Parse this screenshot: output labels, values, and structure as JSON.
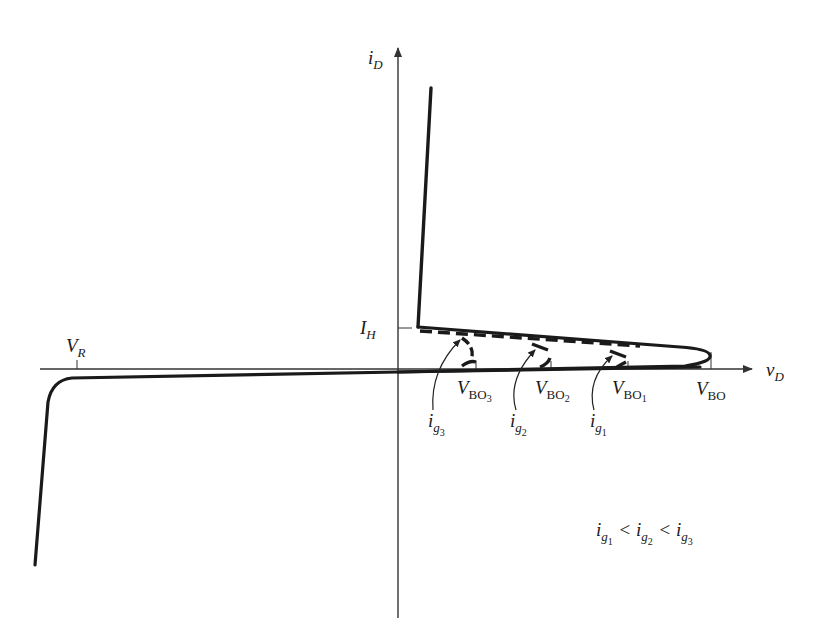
{
  "diagram": {
    "type": "thyristor-iv-characteristic",
    "colors": {
      "curve": "#1a1a1a",
      "axis": "#333333",
      "background": "#ffffff"
    },
    "axes": {
      "y": {
        "symbol": "i",
        "subscript": "D"
      },
      "x": {
        "symbol": "v",
        "subscript": "D"
      }
    },
    "labels": {
      "holding_current": {
        "symbol": "I",
        "subscript": "H"
      },
      "reverse_voltage": {
        "symbol": "V",
        "subscript": "R"
      },
      "breakover": {
        "symbol": "V",
        "subscript": "BO"
      },
      "breakover_1": {
        "symbol": "V",
        "subscript": "BO",
        "index": "1"
      },
      "breakover_2": {
        "symbol": "V",
        "subscript": "BO",
        "index": "2"
      },
      "breakover_3": {
        "symbol": "V",
        "subscript": "BO",
        "index": "3"
      },
      "gate_1": {
        "symbol": "i",
        "subscript": "g",
        "index": "1"
      },
      "gate_2": {
        "symbol": "i",
        "subscript": "g",
        "index": "2"
      },
      "gate_3": {
        "symbol": "i",
        "subscript": "g",
        "index": "3"
      }
    },
    "relation": {
      "terms": [
        {
          "symbol": "i",
          "subscript": "g",
          "index": "1"
        },
        {
          "symbol": "i",
          "subscript": "g",
          "index": "2"
        },
        {
          "symbol": "i",
          "subscript": "g",
          "index": "3"
        }
      ],
      "operator": "<"
    }
  }
}
